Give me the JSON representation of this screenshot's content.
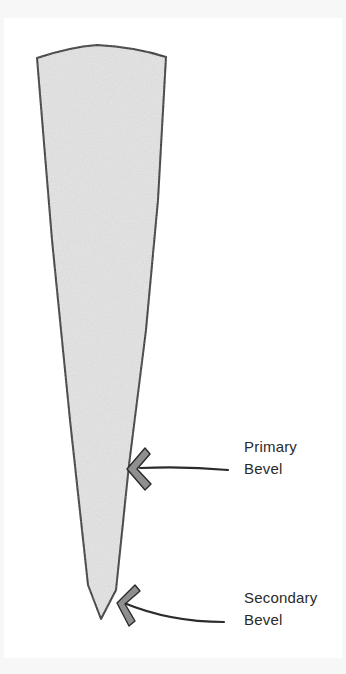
{
  "diagram": {
    "colors": {
      "outline": "#2b2b2b",
      "blade_fill": "#e4e4e4",
      "arrow_fill": "#8f8f8f",
      "background": "#ffffff"
    },
    "labels": [
      {
        "id": "primary",
        "line1": "Primary",
        "line2": "Bevel"
      },
      {
        "id": "secondary",
        "line1": "Secondary",
        "line2": "Bevel"
      }
    ]
  }
}
